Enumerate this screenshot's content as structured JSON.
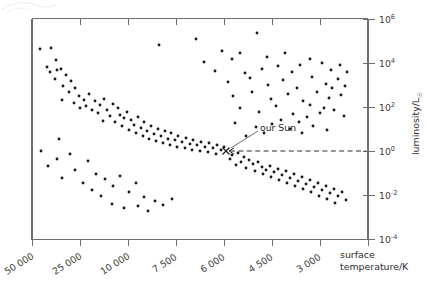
{
  "figure": {
    "kind": "hertzsprung-russell-diagram",
    "background": "#ffffff",
    "frame_color": "#6f6f70",
    "point_color": "#1a1a1a"
  },
  "chart_data": {
    "type": "scatter",
    "title": "",
    "xlabel": "surface temperature/K",
    "ylabel": "luminosity/L☉",
    "grid": false,
    "legend": null,
    "x_axis": {
      "label": "surface temperature/K",
      "label_line1": "surface",
      "label_line2": "temperature/K",
      "tick_labels": [
        "50 000",
        "25 000",
        "10 000",
        "7 500",
        "6 000",
        "4 500",
        "3 000"
      ],
      "tick_values": [
        50000,
        25000,
        10000,
        7500,
        6000,
        4500,
        3000
      ],
      "tick_positions_px": [
        32,
        80,
        128,
        176,
        224,
        272,
        320
      ],
      "label_rotation_deg": -32,
      "direction": "decreasing",
      "scale": "non-linear-categorical"
    },
    "y_axis": {
      "label": "luminosity/L☉",
      "label_base": "luminosity/L",
      "label_subscript": "☉",
      "tick_labels": [
        "10⁶",
        "10⁴",
        "10²",
        "10⁰",
        "10⁻²",
        "10⁻⁴"
      ],
      "tick_mantissa": "10",
      "tick_exponents": [
        "6",
        "4",
        "2",
        "0",
        "-2",
        "-4"
      ],
      "tick_values": [
        1000000,
        10000,
        100,
        1,
        0.01,
        0.0001
      ],
      "tick_positions_px": [
        19,
        63,
        107,
        151,
        195,
        239
      ],
      "scale": "log10",
      "ylim": [
        0.0001,
        1000000
      ]
    },
    "annotations": [
      {
        "name": "our-sun",
        "text": "our Sun",
        "marker": "x",
        "marker_px": {
          "x": 226,
          "y": 151
        },
        "text_px": {
          "x": 262,
          "y": 128
        },
        "leader_from_px": {
          "x": 259,
          "y": 131
        },
        "leader_to_px": {
          "x": 230,
          "y": 148
        },
        "guide_line": {
          "from_px": {
            "x": 229,
            "y": 151
          },
          "to_px": {
            "x": 368,
            "y": 151
          },
          "style": "dashed"
        },
        "data_value": {
          "temperature_K": 5800,
          "luminosity_Lsun": 1
        }
      }
    ],
    "points_px": [
      [
        40,
        49
      ],
      [
        51,
        48
      ],
      [
        56,
        60
      ],
      [
        47,
        67
      ],
      [
        57,
        70
      ],
      [
        61,
        69
      ],
      [
        50,
        72
      ],
      [
        55,
        79
      ],
      [
        66,
        75
      ],
      [
        71,
        81
      ],
      [
        63,
        86
      ],
      [
        69,
        92
      ],
      [
        75,
        88
      ],
      [
        79,
        96
      ],
      [
        62,
        100
      ],
      [
        74,
        103
      ],
      [
        84,
        100
      ],
      [
        89,
        94
      ],
      [
        80,
        108
      ],
      [
        86,
        106
      ],
      [
        95,
        101
      ],
      [
        92,
        110
      ],
      [
        100,
        105
      ],
      [
        104,
        99
      ],
      [
        98,
        113
      ],
      [
        107,
        110
      ],
      [
        110,
        116
      ],
      [
        103,
        121
      ],
      [
        113,
        104
      ],
      [
        118,
        108
      ],
      [
        120,
        115
      ],
      [
        115,
        122
      ],
      [
        124,
        118
      ],
      [
        127,
        112
      ],
      [
        131,
        120
      ],
      [
        122,
        126
      ],
      [
        134,
        125
      ],
      [
        138,
        117
      ],
      [
        129,
        130
      ],
      [
        141,
        128
      ],
      [
        144,
        122
      ],
      [
        136,
        133
      ],
      [
        147,
        131
      ],
      [
        151,
        126
      ],
      [
        143,
        136
      ],
      [
        154,
        134
      ],
      [
        158,
        129
      ],
      [
        149,
        139
      ],
      [
        161,
        136
      ],
      [
        165,
        131
      ],
      [
        156,
        141
      ],
      [
        168,
        139
      ],
      [
        171,
        133
      ],
      [
        163,
        143
      ],
      [
        175,
        140
      ],
      [
        178,
        136
      ],
      [
        170,
        145
      ],
      [
        182,
        142
      ],
      [
        186,
        138
      ],
      [
        177,
        147
      ],
      [
        190,
        144
      ],
      [
        193,
        140
      ],
      [
        185,
        148
      ],
      [
        197,
        145
      ],
      [
        201,
        142
      ],
      [
        192,
        150
      ],
      [
        205,
        147
      ],
      [
        209,
        143
      ],
      [
        200,
        151
      ],
      [
        213,
        148
      ],
      [
        217,
        145
      ],
      [
        208,
        152
      ],
      [
        221,
        150
      ],
      [
        224,
        147
      ],
      [
        216,
        154
      ],
      [
        232,
        155
      ],
      [
        238,
        153
      ],
      [
        230,
        159
      ],
      [
        244,
        157
      ],
      [
        241,
        162
      ],
      [
        236,
        165
      ],
      [
        249,
        160
      ],
      [
        253,
        164
      ],
      [
        246,
        168
      ],
      [
        258,
        162
      ],
      [
        262,
        167
      ],
      [
        255,
        171
      ],
      [
        266,
        170
      ],
      [
        270,
        166
      ],
      [
        263,
        174
      ],
      [
        274,
        172
      ],
      [
        278,
        169
      ],
      [
        271,
        177
      ],
      [
        282,
        175
      ],
      [
        286,
        171
      ],
      [
        279,
        180
      ],
      [
        290,
        178
      ],
      [
        294,
        174
      ],
      [
        287,
        183
      ],
      [
        298,
        181
      ],
      [
        302,
        177
      ],
      [
        295,
        186
      ],
      [
        306,
        184
      ],
      [
        310,
        180
      ],
      [
        303,
        189
      ],
      [
        314,
        187
      ],
      [
        318,
        183
      ],
      [
        311,
        192
      ],
      [
        322,
        190
      ],
      [
        326,
        186
      ],
      [
        319,
        196
      ],
      [
        330,
        193
      ],
      [
        334,
        189
      ],
      [
        327,
        199
      ],
      [
        338,
        196
      ],
      [
        342,
        192
      ],
      [
        335,
        203
      ],
      [
        346,
        200
      ],
      [
        159,
        45
      ],
      [
        196,
        39
      ],
      [
        222,
        51
      ],
      [
        240,
        53
      ],
      [
        257,
        33
      ],
      [
        204,
        62
      ],
      [
        232,
        59
      ],
      [
        267,
        57
      ],
      [
        285,
        53
      ],
      [
        300,
        65
      ],
      [
        215,
        71
      ],
      [
        245,
        73
      ],
      [
        262,
        69
      ],
      [
        278,
        66
      ],
      [
        292,
        72
      ],
      [
        310,
        59
      ],
      [
        322,
        63
      ],
      [
        331,
        70
      ],
      [
        340,
        65
      ],
      [
        347,
        72
      ],
      [
        228,
        82
      ],
      [
        250,
        78
      ],
      [
        268,
        85
      ],
      [
        283,
        80
      ],
      [
        297,
        88
      ],
      [
        312,
        77
      ],
      [
        326,
        84
      ],
      [
        338,
        79
      ],
      [
        332,
        88
      ],
      [
        345,
        86
      ],
      [
        233,
        96
      ],
      [
        252,
        92
      ],
      [
        271,
        99
      ],
      [
        288,
        94
      ],
      [
        303,
        101
      ],
      [
        317,
        92
      ],
      [
        329,
        98
      ],
      [
        341,
        95
      ],
      [
        310,
        105
      ],
      [
        324,
        108
      ],
      [
        240,
        108
      ],
      [
        259,
        112
      ],
      [
        276,
        106
      ],
      [
        293,
        114
      ],
      [
        307,
        117
      ],
      [
        320,
        113
      ],
      [
        334,
        110
      ],
      [
        344,
        116
      ],
      [
        281,
        120
      ],
      [
        299,
        122
      ],
      [
        235,
        123
      ],
      [
        256,
        127
      ],
      [
        272,
        124
      ],
      [
        290,
        129
      ],
      [
        313,
        126
      ],
      [
        327,
        130
      ],
      [
        302,
        133
      ],
      [
        264,
        133
      ],
      [
        246,
        136
      ],
      [
        59,
        139
      ],
      [
        41,
        151
      ],
      [
        57,
        159
      ],
      [
        70,
        154
      ],
      [
        48,
        166
      ],
      [
        75,
        170
      ],
      [
        62,
        178
      ],
      [
        88,
        161
      ],
      [
        96,
        174
      ],
      [
        83,
        183
      ],
      [
        105,
        179
      ],
      [
        92,
        190
      ],
      [
        113,
        186
      ],
      [
        120,
        176
      ],
      [
        101,
        196
      ],
      [
        129,
        192
      ],
      [
        136,
        183
      ],
      [
        144,
        197
      ],
      [
        112,
        204
      ],
      [
        138,
        206
      ],
      [
        155,
        201
      ],
      [
        124,
        208
      ],
      [
        163,
        205
      ],
      [
        148,
        211
      ],
      [
        172,
        199
      ]
    ]
  },
  "paper": {
    "curl_present": true
  }
}
